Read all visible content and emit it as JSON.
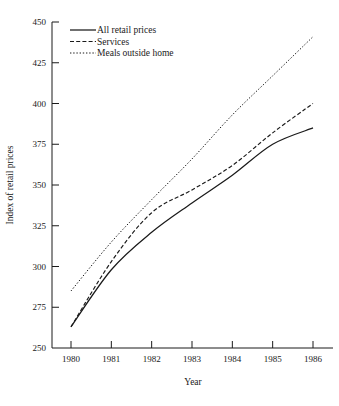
{
  "chart_data": {
    "type": "line",
    "title": "",
    "xlabel": "Year",
    "ylabel": "Index of retail prices",
    "x": [
      1980,
      1981,
      1982,
      1983,
      1984,
      1985,
      1986
    ],
    "xtick_labels": [
      "1980",
      "1981",
      "1982",
      "1983",
      "1984",
      "1985",
      "1986"
    ],
    "ytick_labels": [
      "250",
      "275",
      "300",
      "325",
      "350",
      "375",
      "400",
      "425",
      "450"
    ],
    "yticks": [
      250,
      275,
      300,
      325,
      350,
      375,
      400,
      425,
      450
    ],
    "xlim": [
      1980,
      1986
    ],
    "ylim": [
      250,
      450
    ],
    "grid": false,
    "legend_position": "top-left",
    "series": [
      {
        "name": "All retail prices",
        "style": "solid",
        "values": [
          263,
          298,
          321,
          339,
          356,
          375,
          385
        ]
      },
      {
        "name": "Services",
        "style": "dashed",
        "values": [
          263,
          303,
          333,
          347,
          362,
          382,
          400
        ]
      },
      {
        "name": "Meals outside home",
        "style": "dotted",
        "values": [
          285,
          315,
          341,
          366,
          393,
          417,
          441
        ]
      }
    ]
  },
  "legend": {
    "items": [
      {
        "label": "All retail prices",
        "style": "solid"
      },
      {
        "label": "Services",
        "style": "dashed"
      },
      {
        "label": "Meals outside home",
        "style": "dotted"
      }
    ]
  },
  "axes": {
    "y_title": "Index of retail prices",
    "x_title": "Year"
  }
}
